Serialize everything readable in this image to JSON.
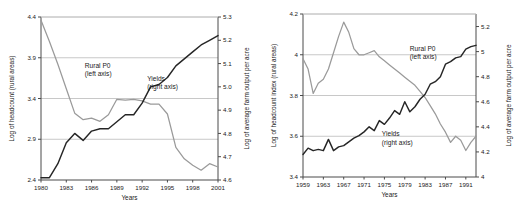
{
  "figure": {
    "title": "",
    "panel_count": 2
  },
  "chart_data": [
    {
      "type": "line",
      "id": "panel-left",
      "title": "",
      "xlabel": "Years",
      "ylabel": "Log of headcount (rural areas)",
      "y2label": "Log of average farm output per acre",
      "xlim": [
        1980,
        2001
      ],
      "ylim": [
        2.4,
        4.4
      ],
      "y2lim": [
        4.6,
        5.3
      ],
      "grid": true,
      "grid_axis": "y",
      "legend_position": "inside-annotations",
      "xticks": [
        "1980",
        "1983",
        "1986",
        "1989",
        "1992",
        "1995",
        "1998",
        "2001"
      ],
      "xtick_values": [
        1980,
        1983,
        1986,
        1989,
        1992,
        1995,
        1998,
        2001
      ],
      "yticks": [
        "2.4",
        "2.9",
        "3.4",
        "3.9",
        "4.4"
      ],
      "ytick_values": [
        2.4,
        2.9,
        3.4,
        3.9,
        4.4
      ],
      "y2ticks": [
        "4.6",
        "4.7",
        "4.8",
        "4.9",
        "5.0",
        "5.1",
        "5.2",
        "5.3"
      ],
      "y2tick_values": [
        4.6,
        4.7,
        4.8,
        4.9,
        5.0,
        5.1,
        5.2,
        5.3
      ],
      "annotations": [
        {
          "text": "Rural P0",
          "sub": "(left axis)",
          "x": 1985.2,
          "y": 3.78
        },
        {
          "text": "Yields",
          "sub": "(right axis)",
          "x": 1992.6,
          "y": 3.62
        }
      ],
      "x": [
        1980,
        1981,
        1982,
        1983,
        1984,
        1985,
        1986,
        1987,
        1988,
        1989,
        1990,
        1991,
        1992,
        1993,
        1994,
        1995,
        1996,
        1997,
        1998,
        1999,
        2000,
        2001
      ],
      "series": [
        {
          "name": "Rural P0",
          "axis": "left",
          "color": "#9a9a9a",
          "values": [
            4.36,
            4.1,
            3.82,
            3.52,
            3.22,
            3.14,
            3.16,
            3.12,
            3.2,
            3.39,
            3.38,
            3.39,
            3.37,
            3.33,
            3.33,
            3.21,
            2.8,
            2.66,
            2.58,
            2.52,
            2.6,
            2.56
          ]
        },
        {
          "name": "Yields",
          "axis": "right",
          "color": "#262626",
          "values": [
            4.61,
            4.61,
            4.67,
            4.76,
            4.8,
            4.77,
            4.81,
            4.82,
            4.82,
            4.85,
            4.88,
            4.88,
            4.93,
            5.0,
            5.01,
            5.04,
            5.09,
            5.12,
            5.15,
            5.18,
            5.2,
            5.22
          ]
        }
      ]
    },
    {
      "type": "line",
      "id": "panel-right",
      "title": "",
      "xlabel": "Years",
      "ylabel": "Log of headcount index (rural areas)",
      "y2label": "Log of average farm output per acre",
      "xlim": [
        1959,
        1993
      ],
      "ylim": [
        3.4,
        4.2
      ],
      "y2lim": [
        4.0,
        5.3
      ],
      "grid": true,
      "grid_axis": "y",
      "legend_position": "inside-annotations",
      "xticks": [
        "1959",
        "1963",
        "1967",
        "1971",
        "1975",
        "1979",
        "1983",
        "1987",
        "1991"
      ],
      "xtick_values": [
        1959,
        1963,
        1967,
        1971,
        1975,
        1979,
        1983,
        1987,
        1991
      ],
      "yticks": [
        "3.4",
        "3.6",
        "3.8",
        "4",
        "4.2"
      ],
      "ytick_values": [
        3.4,
        3.6,
        3.8,
        4.0,
        4.2
      ],
      "y2ticks": [
        "4",
        "4.2",
        "4.4",
        "4.6",
        "4.8",
        "5",
        "5.2"
      ],
      "y2tick_values": [
        4.0,
        4.2,
        4.4,
        4.6,
        4.8,
        5.0,
        5.2
      ],
      "annotations": [
        {
          "text": "Rural P0",
          "sub": "(left axis)",
          "x": 1980.0,
          "y": 4.02
        },
        {
          "text": "Yields",
          "sub": "(right axis)",
          "x": 1974.5,
          "y": 3.6
        }
      ],
      "x": [
        1959,
        1960,
        1961,
        1962,
        1963,
        1964,
        1965,
        1966,
        1967,
        1968,
        1969,
        1970,
        1971,
        1972,
        1973,
        1974,
        1975,
        1976,
        1977,
        1978,
        1979,
        1980,
        1981,
        1982,
        1983,
        1984,
        1985,
        1986,
        1987,
        1988,
        1989,
        1990,
        1991,
        1992,
        1993
      ],
      "series": [
        {
          "name": "Rural P0",
          "axis": "left",
          "color": "#9a9a9a",
          "values": [
            3.98,
            3.93,
            3.81,
            3.86,
            3.88,
            3.93,
            4.01,
            4.09,
            4.16,
            4.11,
            4.03,
            4.0,
            4.0,
            4.01,
            4.02,
            3.99,
            3.97,
            3.95,
            3.93,
            3.91,
            3.89,
            3.87,
            3.85,
            3.82,
            3.79,
            3.75,
            3.71,
            3.66,
            3.62,
            3.57,
            3.6,
            3.58,
            3.53,
            3.57,
            3.6
          ]
        },
        {
          "name": "Yields",
          "axis": "right",
          "color": "#262626",
          "values": [
            4.18,
            4.23,
            4.21,
            4.22,
            4.21,
            4.3,
            4.21,
            4.24,
            4.25,
            4.28,
            4.31,
            4.33,
            4.36,
            4.4,
            4.37,
            4.45,
            4.42,
            4.47,
            4.53,
            4.5,
            4.6,
            4.52,
            4.56,
            4.62,
            4.66,
            4.74,
            4.76,
            4.8,
            4.9,
            4.92,
            4.95,
            4.96,
            5.02,
            5.04,
            5.05
          ]
        }
      ]
    }
  ]
}
